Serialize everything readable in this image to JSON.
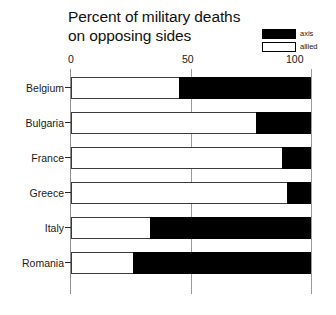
{
  "chart_data": {
    "type": "bar",
    "orientation": "horizontal",
    "stacked": true,
    "normalized_percent": true,
    "title": "Percent of military deaths on opposing sides",
    "title_lines": [
      "Percent of military deaths",
      "on opposing sides"
    ],
    "xlabel": "",
    "ylabel": "",
    "xlim": [
      0,
      100
    ],
    "xticks": [
      0,
      50,
      100
    ],
    "xtick_labels": [
      "0",
      "50",
      "100"
    ],
    "grid": true,
    "grid_axis": "x",
    "legend_position": "top-right",
    "categories": [
      "Belgium",
      "Bulgaria",
      "France",
      "Greece",
      "Italy",
      "Romania"
    ],
    "series": [
      {
        "name": "allied",
        "color": "#ffffff",
        "values": [
          45,
          77,
          88,
          90,
          33,
          26
        ]
      },
      {
        "name": "axis",
        "color": "#000000",
        "values": [
          55,
          23,
          12,
          10,
          67,
          74
        ]
      }
    ]
  },
  "legend": {
    "items": [
      {
        "label": "axis",
        "swatch": "axis"
      },
      {
        "label": "allied",
        "swatch": "allied"
      }
    ]
  },
  "axis": {
    "ticks": [
      {
        "label": "0",
        "class": "t0"
      },
      {
        "label": "50",
        "class": "t50"
      },
      {
        "label": "100",
        "class": "t100"
      }
    ]
  }
}
